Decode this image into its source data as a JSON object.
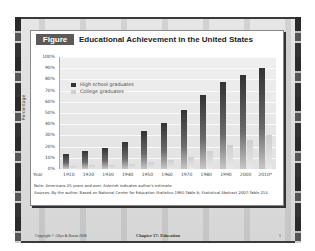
{
  "figure": {
    "badge": "Figure 17.1",
    "title": "Educational Achievement in the United States"
  },
  "chart_data": {
    "type": "bar",
    "title": "Educational Achievement in the United States",
    "xlabel": "Year",
    "ylabel": "Percentage",
    "ylim": [
      0,
      100
    ],
    "yticks": [
      "0%",
      "10%",
      "20%",
      "30%",
      "40%",
      "50%",
      "60%",
      "70%",
      "80%",
      "90%",
      "100%"
    ],
    "grid": true,
    "legend_position": "upper-left",
    "categories": [
      "1910",
      "1920",
      "1930",
      "1940",
      "1950",
      "1960",
      "1970",
      "1980",
      "1990",
      "2000",
      "2010*"
    ],
    "series": [
      {
        "name": "High school graduates",
        "values": [
          13.5,
          16.4,
          19.1,
          24.5,
          34.3,
          41.1,
          52.3,
          66.5,
          77.6,
          84.1,
          90.0
        ]
      },
      {
        "name": "College graduates",
        "values": [
          2.7,
          3.3,
          3.9,
          4.6,
          6.2,
          7.7,
          10.7,
          16.2,
          21.3,
          25.6,
          30.0
        ]
      }
    ]
  },
  "legend": {
    "hs": "High school graduates",
    "college": "College graduates"
  },
  "axis": {
    "year_label": "Year",
    "y_label": "Percentage"
  },
  "notes": {
    "note": "Note: Americans 25 years and over. Asterisk indicates author's estimate.",
    "sources": "Sources: By the author. Based on National Center for Education Statistics 1991:Table 8; Statistical Abstract 2007:Table 214."
  },
  "footer": {
    "copyright": "Copyright © Allyn & Bacon 2008",
    "chapter": "Chapter 17: Education",
    "page": "1"
  },
  "colors": {
    "hs_bar": "#333333",
    "college_bar": "#cfcfcf",
    "badge_bg": "#5a5a5a"
  }
}
